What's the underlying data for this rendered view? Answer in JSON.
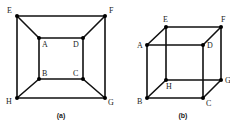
{
  "figures": [
    {
      "id": "a",
      "caption": "(a)",
      "description": "Planar drawing of cube graph",
      "vertices": [
        {
          "name": "E"
        },
        {
          "name": "F"
        },
        {
          "name": "A"
        },
        {
          "name": "D"
        },
        {
          "name": "B"
        },
        {
          "name": "C"
        },
        {
          "name": "H"
        },
        {
          "name": "G"
        }
      ],
      "edges": [
        [
          "E",
          "F"
        ],
        [
          "F",
          "G"
        ],
        [
          "G",
          "H"
        ],
        [
          "H",
          "E"
        ],
        [
          "A",
          "D"
        ],
        [
          "D",
          "C"
        ],
        [
          "C",
          "B"
        ],
        [
          "B",
          "A"
        ],
        [
          "E",
          "A"
        ],
        [
          "F",
          "D"
        ],
        [
          "G",
          "C"
        ],
        [
          "H",
          "B"
        ]
      ]
    },
    {
      "id": "b",
      "caption": "(b)",
      "description": "Perspective drawing of cube",
      "vertices": [
        {
          "name": "E"
        },
        {
          "name": "F"
        },
        {
          "name": "A"
        },
        {
          "name": "D"
        },
        {
          "name": "H"
        },
        {
          "name": "G"
        },
        {
          "name": "B"
        },
        {
          "name": "C"
        }
      ],
      "edges": [
        [
          "A",
          "D"
        ],
        [
          "D",
          "C"
        ],
        [
          "C",
          "B"
        ],
        [
          "B",
          "A"
        ],
        [
          "E",
          "F"
        ],
        [
          "F",
          "G"
        ],
        [
          "G",
          "H"
        ],
        [
          "H",
          "E"
        ],
        [
          "A",
          "E"
        ],
        [
          "D",
          "F"
        ],
        [
          "C",
          "G"
        ],
        [
          "B",
          "H"
        ]
      ]
    }
  ]
}
